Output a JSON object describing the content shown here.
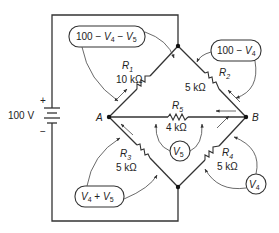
{
  "source": {
    "voltage_label": "100 V",
    "plus": "+",
    "minus": "−"
  },
  "nodes": {
    "A": "A",
    "B": "B"
  },
  "resistors": [
    {
      "name": "R",
      "sub": "1",
      "value": "10 kΩ"
    },
    {
      "name": "R",
      "sub": "2",
      "value": "5 kΩ"
    },
    {
      "name": "R",
      "sub": "3",
      "value": "5 kΩ"
    },
    {
      "name": "R",
      "sub": "4",
      "value": "5 kΩ"
    },
    {
      "name": "R",
      "sub": "5",
      "value": "4 kΩ"
    }
  ],
  "voltage_boxes": {
    "r1": {
      "prefix": "100 − ",
      "v1": "V",
      "s1": "4",
      "mid": " − ",
      "v2": "V",
      "s2": "5"
    },
    "r2": {
      "prefix": "100 − ",
      "v1": "V",
      "s1": "4"
    },
    "r3": {
      "v1": "V",
      "s1": "4",
      "mid": " + ",
      "v2": "V",
      "s2": "5"
    }
  },
  "meters": [
    {
      "v": "V",
      "sub": "5"
    },
    {
      "v": "V",
      "sub": "4"
    }
  ]
}
